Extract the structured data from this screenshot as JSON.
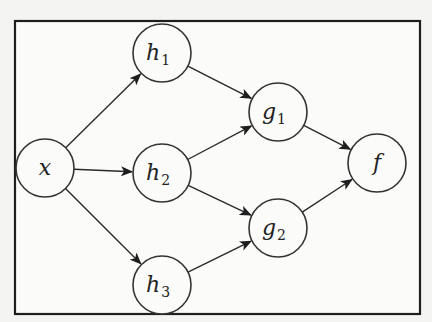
{
  "diagram": {
    "title": "",
    "nodes": [
      {
        "id": "x",
        "label": "x",
        "subscript": ""
      },
      {
        "id": "h1",
        "label": "h",
        "subscript": "1"
      },
      {
        "id": "h2",
        "label": "h",
        "subscript": "2"
      },
      {
        "id": "h3",
        "label": "h",
        "subscript": "3"
      },
      {
        "id": "g1",
        "label": "g",
        "subscript": "1"
      },
      {
        "id": "g2",
        "label": "g",
        "subscript": "2"
      },
      {
        "id": "f",
        "label": "f",
        "subscript": ""
      }
    ],
    "edges": [
      {
        "from": "x",
        "to": "h1"
      },
      {
        "from": "x",
        "to": "h2"
      },
      {
        "from": "x",
        "to": "h3"
      },
      {
        "from": "h1",
        "to": "g1"
      },
      {
        "from": "h2",
        "to": "g1"
      },
      {
        "from": "h2",
        "to": "g2"
      },
      {
        "from": "h3",
        "to": "g2"
      },
      {
        "from": "g1",
        "to": "f"
      },
      {
        "from": "g2",
        "to": "f"
      }
    ],
    "colors": {
      "stroke": "#2a2a2a",
      "background": "#fbfbf9"
    }
  }
}
